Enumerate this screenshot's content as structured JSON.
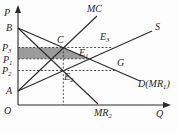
{
  "figure": {
    "colors": {
      "background": "#fdfdfd",
      "line": "#2a2a2a",
      "dash": "#3a3a3a",
      "shade": "#9b9b9b",
      "text": "#1f1f1f"
    },
    "axis": {
      "y_label": "P",
      "x_label": "Q",
      "origin_label": "O"
    },
    "shaded_region": {
      "name": "shaded-welfare-region",
      "points": [
        [
          18,
          47.5
        ],
        [
          63.5,
          47.5
        ],
        [
          89,
          58.8
        ],
        [
          18,
          58.8
        ]
      ]
    },
    "lines": [
      {
        "name": "p-axis",
        "x1": 18,
        "y1": 105,
        "x2": 18,
        "y2": 11
      },
      {
        "name": "q-axis",
        "x1": 18,
        "y1": 105,
        "x2": 164,
        "y2": 105
      },
      {
        "name": "line-demand-D",
        "x1": 18,
        "y1": 28,
        "x2": 140,
        "y2": 81
      },
      {
        "name": "line-MR2",
        "x1": 18,
        "y1": 28,
        "x2": 98,
        "y2": 104
      },
      {
        "name": "line-supply-S",
        "x1": 18,
        "y1": 91,
        "x2": 152,
        "y2": 31
      },
      {
        "name": "line-MC",
        "x1": 18,
        "y1": 91,
        "x2": 97,
        "y2": 16
      }
    ],
    "arrowheads": [
      {
        "name": "p-axis-arrowhead",
        "points": "15,13 18,5 21,13"
      },
      {
        "name": "q-axis-arrowhead",
        "points": "163,102 171,105 163,108"
      }
    ],
    "dashed_lines": [
      {
        "name": "dash-P3-level",
        "x1": 18,
        "y1": 47.5,
        "x2": 113,
        "y2": 47.5
      },
      {
        "name": "dash-P1-level",
        "x1": 18,
        "y1": 58.8,
        "x2": 89,
        "y2": 58.8
      },
      {
        "name": "dash-P2-level",
        "x1": 18,
        "y1": 70.5,
        "x2": 116,
        "y2": 70.5
      },
      {
        "name": "dash-quantity-vertical",
        "x1": 63.3,
        "y1": 47.5,
        "x2": 63.3,
        "y2": 105
      }
    ],
    "labels": [
      {
        "name": "label-P-axis",
        "text": "P",
        "x": 4,
        "y": 16
      },
      {
        "name": "label-B",
        "text": "B",
        "x": 6,
        "y": 31
      },
      {
        "name": "label-P3",
        "text": "P_3_",
        "x": 2,
        "y": 51
      },
      {
        "name": "label-P1",
        "text": "P_1_",
        "x": 3,
        "y": 62.5
      },
      {
        "name": "label-P2",
        "text": "P_2_",
        "x": 2,
        "y": 74
      },
      {
        "name": "label-A",
        "text": "A",
        "x": 6,
        "y": 94
      },
      {
        "name": "label-O",
        "text": "O",
        "x": 4,
        "y": 114
      },
      {
        "name": "label-Q-axis",
        "text": "Q",
        "x": 156,
        "y": 117
      },
      {
        "name": "label-MC",
        "text": "MC",
        "x": 87,
        "y": 12
      },
      {
        "name": "label-S",
        "text": "S",
        "x": 155,
        "y": 30
      },
      {
        "name": "label-E3",
        "text": "E_3_",
        "x": 100,
        "y": 40
      },
      {
        "name": "label-C",
        "text": "C",
        "x": 57,
        "y": 43
      },
      {
        "name": "label-E1",
        "text": "E_1_",
        "x": 79,
        "y": 56
      },
      {
        "name": "label-E2",
        "text": "E_2_",
        "x": 64,
        "y": 80
      },
      {
        "name": "label-G",
        "text": "G",
        "x": 117,
        "y": 66
      },
      {
        "name": "label-D-MR1",
        "text": "D(MR_1_)",
        "x": 138,
        "y": 87
      },
      {
        "name": "label-MR2",
        "text": "MR_2_",
        "x": 94,
        "y": 116
      }
    ]
  }
}
